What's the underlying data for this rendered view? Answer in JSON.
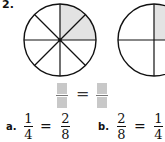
{
  "problem": {
    "number": "2.",
    "circles": [
      {
        "name": "eighths",
        "parts": 8,
        "shaded": 2,
        "shade_color": "#e3e3e3"
      },
      {
        "name": "fourths",
        "parts": 4,
        "shaded": 1,
        "shade_color": "#e3e3e3"
      }
    ],
    "blank_equation": {
      "equals": "="
    },
    "choices": [
      {
        "label": "a.",
        "left_num": "1",
        "left_den": "4",
        "equals": "=",
        "right_num": "2",
        "right_den": "8"
      },
      {
        "label": "b.",
        "left_num": "2",
        "left_den": "8",
        "equals": "=",
        "right_num": "1",
        "right_den": "4"
      }
    ]
  }
}
